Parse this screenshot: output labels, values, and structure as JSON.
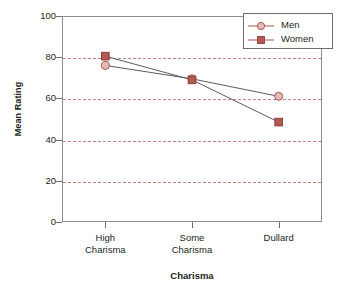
{
  "chart_data": {
    "type": "line",
    "title": "",
    "xlabel": "Charisma",
    "ylabel": "Mean Rating",
    "categories": [
      "High\nCharisma",
      "Some\nCharisma",
      "Dullard"
    ],
    "category_labels": [
      {
        "line1": "High",
        "line2": "Charisma"
      },
      {
        "line1": "Some",
        "line2": "Charisma"
      },
      {
        "line1": "Dullard",
        "line2": ""
      }
    ],
    "series": [
      {
        "name": "Men",
        "values": [
          76,
          69.5,
          61
        ],
        "marker": "circle",
        "marker_fill": "#e3bbb6",
        "marker_stroke": "#a8564f",
        "line_color": "#5a5a5a"
      },
      {
        "name": "Women",
        "values": [
          80.5,
          69,
          48.5
        ],
        "marker": "square",
        "marker_fill": "#b25a51",
        "marker_stroke": "#8c3f38",
        "line_color": "#5a5a5a"
      }
    ],
    "ylim": [
      0,
      100
    ],
    "yticks": [
      0,
      20,
      40,
      60,
      80,
      100
    ],
    "ytick_labels": [
      "0",
      "20",
      "40",
      "60",
      "80",
      "100"
    ],
    "gridlines": [
      20,
      40,
      60,
      80
    ],
    "grid": true,
    "grid_color": "#c4857f",
    "grid_style": "dashed",
    "legend_position": "top-right",
    "legend_entries": [
      "Men",
      "Women"
    ],
    "axis_color": "#8c8c8c",
    "background": "#ffffff"
  }
}
